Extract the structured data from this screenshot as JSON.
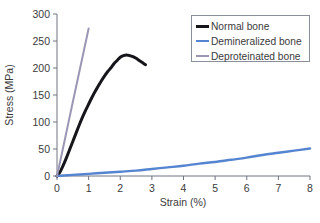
{
  "chart_data": {
    "type": "line",
    "title": "",
    "xlabel": "Strain (%)",
    "ylabel": "Stress (MPa)",
    "xlim": [
      0,
      8
    ],
    "ylim": [
      0,
      300
    ],
    "xticks": [
      "0",
      "1",
      "2",
      "3",
      "4",
      "5",
      "6",
      "7",
      "8"
    ],
    "yticks": [
      "0",
      "50",
      "100",
      "150",
      "200",
      "250",
      "300"
    ],
    "grid": false,
    "legend_position": "top-right",
    "series": [
      {
        "name": "Normal bone",
        "color": "#16161a",
        "linewidth": 3.0,
        "points": [
          [
            0.0,
            0
          ],
          [
            0.1,
            8
          ],
          [
            0.2,
            20
          ],
          [
            0.3,
            34
          ],
          [
            0.4,
            49
          ],
          [
            0.5,
            64
          ],
          [
            0.6,
            79
          ],
          [
            0.7,
            94
          ],
          [
            0.8,
            108
          ],
          [
            0.9,
            121
          ],
          [
            1.0,
            133
          ],
          [
            1.1,
            145
          ],
          [
            1.2,
            156
          ],
          [
            1.3,
            166
          ],
          [
            1.4,
            176
          ],
          [
            1.5,
            185
          ],
          [
            1.6,
            193
          ],
          [
            1.7,
            200
          ],
          [
            1.8,
            208
          ],
          [
            1.9,
            214
          ],
          [
            2.0,
            220
          ],
          [
            2.1,
            223
          ],
          [
            2.2,
            224
          ],
          [
            2.3,
            223
          ],
          [
            2.4,
            221
          ],
          [
            2.5,
            218
          ],
          [
            2.6,
            214
          ],
          [
            2.7,
            210
          ],
          [
            2.8,
            206
          ]
        ]
      },
      {
        "name": "Demineralized bone",
        "color": "#5585d0",
        "linewidth": 2.4,
        "points": [
          [
            0.0,
            0
          ],
          [
            0.2,
            1
          ],
          [
            0.5,
            2
          ],
          [
            1.0,
            4
          ],
          [
            1.5,
            6
          ],
          [
            2.0,
            8
          ],
          [
            2.5,
            10
          ],
          [
            3.0,
            13
          ],
          [
            3.5,
            16
          ],
          [
            4.0,
            19
          ],
          [
            4.5,
            23
          ],
          [
            5.0,
            26
          ],
          [
            5.5,
            30
          ],
          [
            6.0,
            34
          ],
          [
            6.5,
            39
          ],
          [
            7.0,
            43
          ],
          [
            7.5,
            47
          ],
          [
            8.0,
            51
          ]
        ]
      },
      {
        "name": "Deproteinated bone",
        "color": "#9a96b4",
        "linewidth": 2.0,
        "points": [
          [
            0.0,
            0
          ],
          [
            0.25,
            68
          ],
          [
            0.5,
            137
          ],
          [
            0.75,
            205
          ],
          [
            1.0,
            273
          ]
        ]
      }
    ],
    "annotations": []
  },
  "legend": {
    "entries": [
      {
        "label": "Normal bone",
        "swatch": "line-swatch-black"
      },
      {
        "label": "Demineralized bone",
        "swatch": "line-swatch-blue"
      },
      {
        "label": "Deproteinated bone",
        "swatch": "line-swatch-gray"
      }
    ]
  },
  "colors": {
    "normal": "#16161a",
    "demineralized": "#5585d0",
    "deproteinated": "#9a96b4",
    "axis": "#6e7480",
    "text": "#3b3b3b",
    "background": "#ffffff"
  }
}
